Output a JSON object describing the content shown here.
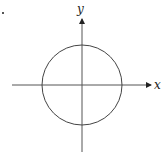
{
  "diagram": {
    "type": "coordinate-plane-with-circle",
    "axes": {
      "x_label": "x",
      "y_label": "y",
      "origin_px": [
        82,
        85
      ],
      "x_axis_px": {
        "from": 12,
        "to": 152
      },
      "y_axis_px": {
        "from": 152,
        "to": 18
      }
    },
    "circle": {
      "center_px": [
        82,
        85
      ],
      "radius_px": 40
    },
    "colors": {
      "stroke": "#444444",
      "axis": "#555555",
      "text": "#222222",
      "background": "#ffffff"
    },
    "stray_mark": "."
  }
}
